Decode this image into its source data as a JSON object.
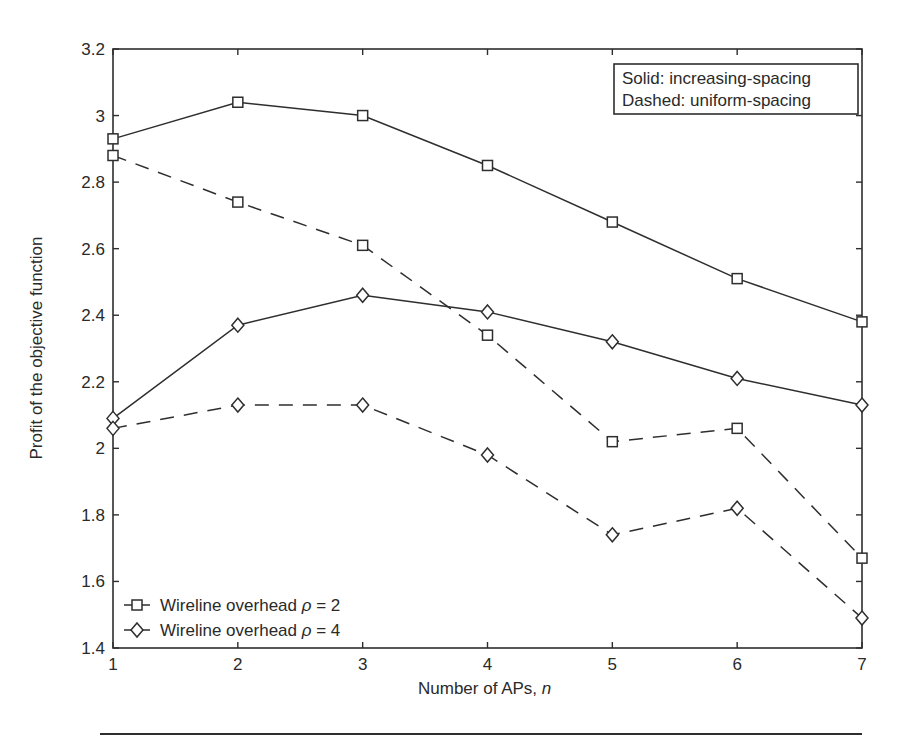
{
  "chart_data": {
    "type": "line",
    "title": "",
    "xlabel": "Number of APs, n",
    "xlabel_parts": {
      "prefix": "Number of APs, ",
      "var": "n"
    },
    "ylabel": "Profit of the objective function",
    "xlim": [
      1,
      7
    ],
    "ylim": [
      1.4,
      3.2
    ],
    "x": [
      1,
      2,
      3,
      4,
      5,
      6,
      7
    ],
    "xticks": [
      "1",
      "2",
      "3",
      "4",
      "5",
      "6",
      "7"
    ],
    "yticks": [
      "1.4",
      "1.6",
      "1.8",
      "2",
      "2.2",
      "2.4",
      "2.6",
      "2.8",
      "3",
      "3.2"
    ],
    "ytick_values": [
      1.4,
      1.6,
      1.8,
      2.0,
      2.2,
      2.4,
      2.6,
      2.8,
      3.0,
      3.2
    ],
    "grid": false,
    "series": [
      {
        "name": "Wireline overhead ρ = 2 (increasing-spacing)",
        "marker": "square",
        "style": "solid",
        "values": [
          2.93,
          3.04,
          3.0,
          2.85,
          2.68,
          2.51,
          2.38
        ]
      },
      {
        "name": "Wireline overhead ρ = 2 (uniform-spacing)",
        "marker": "square",
        "style": "dashed",
        "values": [
          2.88,
          2.74,
          2.61,
          2.34,
          2.02,
          2.06,
          1.67
        ]
      },
      {
        "name": "Wireline overhead ρ = 4 (increasing-spacing)",
        "marker": "diamond",
        "style": "solid",
        "values": [
          2.09,
          2.37,
          2.46,
          2.41,
          2.32,
          2.21,
          2.13
        ]
      },
      {
        "name": "Wireline overhead ρ = 4 (uniform-spacing)",
        "marker": "diamond",
        "style": "dashed",
        "values": [
          2.06,
          2.13,
          2.13,
          1.98,
          1.74,
          1.82,
          1.49
        ]
      }
    ],
    "legend": {
      "position": "lower left",
      "entries": [
        {
          "marker": "square",
          "label": "Wireline overhead ρ = 2",
          "text": "Wireline overhead ",
          "symbol": "ρ",
          "suffix": " = 2"
        },
        {
          "marker": "diamond",
          "label": "Wireline overhead ρ = 4",
          "text": "Wireline overhead ",
          "symbol": "ρ",
          "suffix": " = 4"
        }
      ]
    },
    "annotations": [
      {
        "text": "Solid: increasing-spacing",
        "position": "upper right"
      },
      {
        "text": "Dashed: uniform-spacing",
        "position": "upper right"
      }
    ]
  },
  "colors": {
    "line": "#2e2e2e",
    "background": "#ffffff"
  }
}
